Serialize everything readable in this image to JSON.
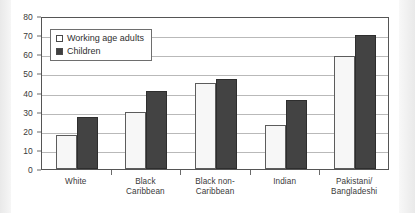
{
  "chart_data": {
    "type": "bar",
    "title": "",
    "xlabel": "",
    "ylabel": "",
    "ylim": [
      0,
      80
    ],
    "ytick_step": 10,
    "yticks": [
      0,
      10,
      20,
      30,
      40,
      50,
      60,
      70,
      80
    ],
    "grid": true,
    "legend_position": "top-left",
    "categories": [
      "White",
      "Black\nCaribbean",
      "Black non-\nCaribbean",
      "Indian",
      "Pakistani/\nBangladeshi"
    ],
    "series": [
      {
        "name": "Working age adults",
        "values": [
          18,
          30,
          45,
          23,
          59
        ],
        "color": "#f7f7f7"
      },
      {
        "name": "Children",
        "values": [
          27,
          41,
          47,
          36,
          70
        ],
        "color": "#434343"
      }
    ]
  },
  "legend": {
    "items": [
      {
        "label": "Working age adults",
        "swatch": "adults"
      },
      {
        "label": "Children",
        "swatch": "children"
      }
    ]
  }
}
